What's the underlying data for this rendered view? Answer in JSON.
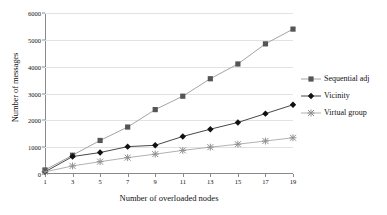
{
  "chart_data": {
    "type": "line",
    "title": "",
    "xlabel": "Number of overloaded nodes",
    "ylabel": "Number of messages",
    "x": [
      1,
      3,
      5,
      7,
      9,
      11,
      13,
      15,
      17,
      19
    ],
    "xticklabels": [
      "1",
      "3",
      "5",
      "7",
      "9",
      "11",
      "13",
      "15",
      "17",
      "19"
    ],
    "yticks": [
      0,
      1000,
      2000,
      3000,
      4000,
      5000,
      6000
    ],
    "yticklabels": [
      "0",
      "1000",
      "2000",
      "3000",
      "4000",
      "5000",
      "6000"
    ],
    "xlim": [
      1,
      19
    ],
    "ylim": [
      0,
      6000
    ],
    "grid": "horizontal",
    "legend_position": "right",
    "series": [
      {
        "name": "Sequential adj",
        "marker": "square",
        "color": "#555555",
        "line_color": "#9a9a9a",
        "values": [
          150,
          700,
          1250,
          1750,
          2400,
          2900,
          3550,
          4100,
          4850,
          5400
        ]
      },
      {
        "name": "Vicinity",
        "marker": "diamond",
        "color": "#111111",
        "line_color": "#333333",
        "values": [
          80,
          650,
          800,
          1020,
          1070,
          1400,
          1670,
          1920,
          2250,
          2580
        ]
      },
      {
        "name": "Virtual group",
        "marker": "asterisk",
        "color": "#8f8f8f",
        "line_color": "#a8a8a8",
        "values": [
          80,
          300,
          460,
          610,
          740,
          880,
          1000,
          1110,
          1230,
          1350
        ]
      }
    ]
  },
  "legend": {
    "items": [
      {
        "label": "Sequential adj"
      },
      {
        "label": "Vicinity"
      },
      {
        "label": "Virtual group"
      }
    ]
  },
  "axes": {
    "x_title": "Number of overloaded nodes",
    "y_title": "Number of messages"
  }
}
